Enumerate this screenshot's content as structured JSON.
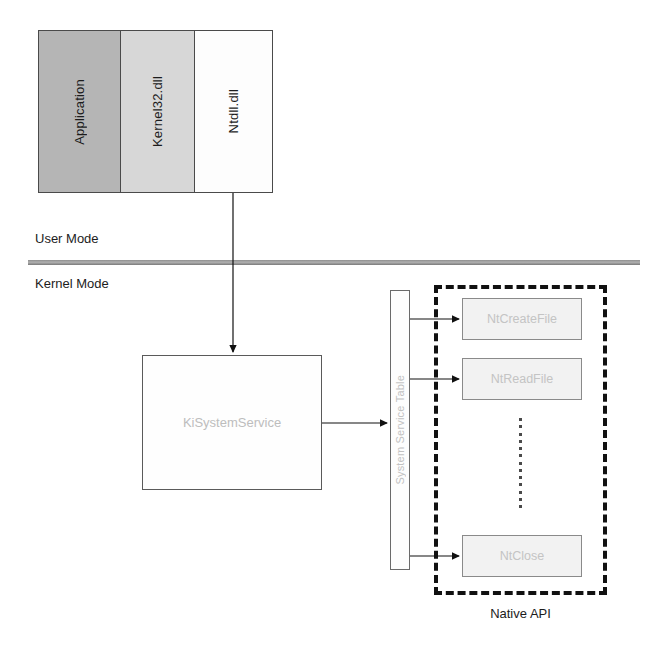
{
  "diagram": {
    "usermode_stack": {
      "panels": [
        {
          "label": "Application",
          "fill": "#b5b5b5"
        },
        {
          "label": "Kernel32.dll",
          "fill": "#d7d7d7"
        },
        {
          "label": "Ntdll.dll",
          "fill": "#fdfdfd"
        }
      ]
    },
    "mode_labels": {
      "user": "User Mode",
      "kernel": "Kernel Mode"
    },
    "kernel": {
      "dispatcher_label": "KiSystemService",
      "service_table_label": "System Service Table"
    },
    "native_api": {
      "caption": "Native API",
      "routines": [
        {
          "label": "NtCreateFile"
        },
        {
          "label": "NtReadFile"
        },
        {
          "label": "NtClose"
        }
      ],
      "ellipsis": "vertical-dotted-continuation"
    },
    "colors": {
      "line": "#111111",
      "divider": "#8e8e8e",
      "box_fill": "#f2f2f2",
      "faded_text": "#c4c4c4"
    }
  }
}
